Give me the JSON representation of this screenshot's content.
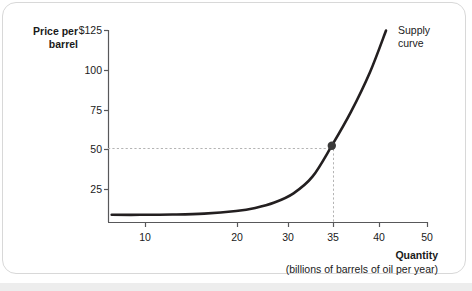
{
  "chart_data": {
    "type": "line",
    "title": "",
    "subtitle": "",
    "xlabel": "Quantity",
    "xlabel_sub": "(billions of barrels of oil per year)",
    "ylabel": "Price per",
    "ylabel_line2": "barrel",
    "xlim": [
      0,
      50
    ],
    "ylim": [
      0,
      125
    ],
    "grid": false,
    "legend_position": "inline-right",
    "x_ticks": [
      {
        "value": 10,
        "label": "10"
      },
      {
        "value": 20,
        "label": "20"
      },
      {
        "value": 30,
        "label": "30"
      },
      {
        "value": 35,
        "label": "35"
      },
      {
        "value": 40,
        "label": "40"
      },
      {
        "value": 50,
        "label": "50"
      }
    ],
    "y_ticks": [
      {
        "value": 125,
        "label": "$125"
      },
      {
        "value": 100,
        "label": "100"
      },
      {
        "value": 75,
        "label": "75"
      },
      {
        "value": 50,
        "label": "50"
      },
      {
        "value": 25,
        "label": "25"
      }
    ],
    "series": [
      {
        "name": "Supply curve",
        "color": "#231f20",
        "points": [
          {
            "x": 0.5,
            "y": 5
          },
          {
            "x": 5,
            "y": 5
          },
          {
            "x": 10,
            "y": 5.2
          },
          {
            "x": 15,
            "y": 5.8
          },
          {
            "x": 20,
            "y": 7.5
          },
          {
            "x": 23,
            "y": 9.5
          },
          {
            "x": 26,
            "y": 13
          },
          {
            "x": 29,
            "y": 19
          },
          {
            "x": 32,
            "y": 30
          },
          {
            "x": 35,
            "y": 50
          },
          {
            "x": 38,
            "y": 72
          },
          {
            "x": 41,
            "y": 98
          },
          {
            "x": 43.5,
            "y": 125
          }
        ]
      }
    ],
    "annotations": [
      {
        "type": "point-marker",
        "label": "equilibrium-point",
        "x": 35,
        "y": 50,
        "color": "#3a3a3a",
        "guide_lines": "dashed",
        "guide_color": "#b0b0b0"
      }
    ]
  },
  "labels": {
    "series_label_line1": "Supply",
    "series_label_line2": "curve"
  }
}
